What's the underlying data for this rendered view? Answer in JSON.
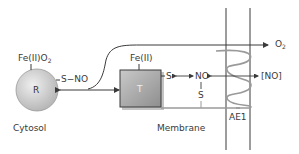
{
  "diagram": {
    "nodes": {
      "hemoglobin_r": {
        "label": "R",
        "ligand_label_main": "Fe(II)O",
        "ligand_label_sub": "2",
        "side_group": "S−NO"
      },
      "hemoglobin_t": {
        "label": "T",
        "ligand_label": "Fe(II)",
        "side_group": "S"
      },
      "no_intermediate": {
        "label": "NO",
        "thiol_label": "S"
      },
      "free_no": {
        "label": "[NO]"
      },
      "oxygen": {
        "label_main": "O",
        "label_sub": "2"
      },
      "transporter": {
        "label": "AE1"
      }
    },
    "regions": {
      "cytosol": "Cytosol",
      "membrane": "Membrane"
    },
    "colors": {
      "line": "#3a3a3a",
      "coil": "#9a9a9a",
      "circle_fill": "#cfcfcf",
      "box_fill": "#a9a9a9"
    }
  }
}
